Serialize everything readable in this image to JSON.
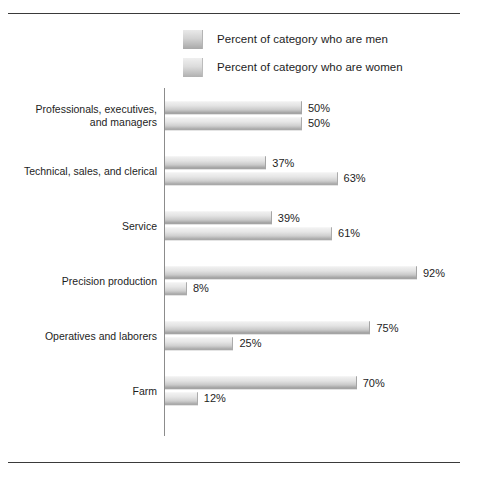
{
  "chart_data": {
    "type": "bar",
    "orientation": "horizontal",
    "title": "",
    "xlabel": "",
    "ylabel": "",
    "grid": false,
    "xlim": [
      0,
      100
    ],
    "value_suffix": "%",
    "legend_position": "top",
    "categories": [
      "Professionals, executives,\nand managers",
      "Technical, sales, and clerical",
      "Service",
      "Precision production",
      "Operatives and laborers",
      "Farm"
    ],
    "series": [
      {
        "name": "Percent of category who are men",
        "key": "men",
        "values": [
          50,
          37,
          39,
          92,
          75,
          70
        ],
        "labels": [
          "50%",
          "37%",
          "39%",
          "92%",
          "75%",
          "70%"
        ],
        "color": "#d2d2d2"
      },
      {
        "name": "Percent of category who are women",
        "key": "women",
        "values": [
          50,
          63,
          61,
          8,
          25,
          12
        ],
        "labels": [
          "50%",
          "63%",
          "61%",
          "8%",
          "25%",
          "12%"
        ],
        "color": "#dcdcdc"
      }
    ]
  },
  "legend": {
    "items": [
      {
        "label": "Percent of category who are men",
        "swatch": "men"
      },
      {
        "label": "Percent of category who are women",
        "swatch": "women"
      }
    ]
  },
  "groups": [
    {
      "label": "Professionals, executives,\nand managers",
      "men": {
        "value": 50,
        "label": "50%"
      },
      "women": {
        "value": 50,
        "label": "50%"
      }
    },
    {
      "label": "Technical, sales, and clerical",
      "men": {
        "value": 37,
        "label": "37%"
      },
      "women": {
        "value": 63,
        "label": "63%"
      }
    },
    {
      "label": "Service",
      "men": {
        "value": 39,
        "label": "39%"
      },
      "women": {
        "value": 61,
        "label": "61%"
      }
    },
    {
      "label": "Precision production",
      "men": {
        "value": 92,
        "label": "92%"
      },
      "women": {
        "value": 8,
        "label": "8%"
      }
    },
    {
      "label": "Operatives and laborers",
      "men": {
        "value": 75,
        "label": "75%"
      },
      "women": {
        "value": 25,
        "label": "25%"
      }
    },
    {
      "label": "Farm",
      "men": {
        "value": 70,
        "label": "70%"
      },
      "women": {
        "value": 12,
        "label": "12%"
      }
    }
  ]
}
